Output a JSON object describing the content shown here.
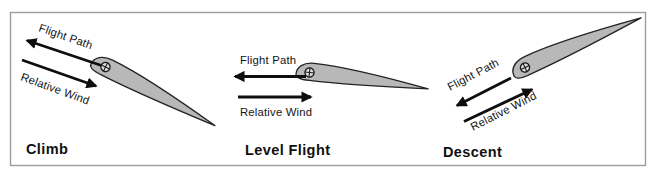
{
  "figure": {
    "type": "diagram",
    "colors": {
      "background": "#ffffff",
      "frame_border": "#9c9c9c",
      "airfoil_fill": "#b8b8b8",
      "airfoil_outline": "#232323",
      "arrow": "#0e0e0e",
      "text": "#141414",
      "cg_fill": "#dedede"
    },
    "panels": [
      {
        "label": "Climb",
        "flight_path_label": "Flight Path",
        "relative_wind_label": "Relative Wind",
        "flight_path_direction": "up-left",
        "relative_wind_direction": "down-right toward airfoil",
        "airfoil_pitch": "nose up"
      },
      {
        "label": "Level Flight",
        "flight_path_label": "Flight Path",
        "relative_wind_label": "Relative Wind",
        "flight_path_direction": "left",
        "relative_wind_direction": "right toward airfoil",
        "airfoil_pitch": "level"
      },
      {
        "label": "Descent",
        "flight_path_label": "Flight Path",
        "relative_wind_label": "Relative Wind",
        "flight_path_direction": "down-left",
        "relative_wind_direction": "up-right toward airfoil",
        "airfoil_pitch": "nose down"
      }
    ]
  }
}
